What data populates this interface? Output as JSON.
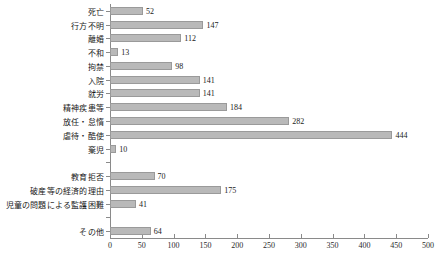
{
  "chart_data": {
    "type": "bar",
    "orientation": "horizontal",
    "title": "",
    "xlabel": "",
    "ylabel": "",
    "xlim": [
      0,
      500
    ],
    "xticks": [
      0,
      50,
      100,
      150,
      200,
      250,
      300,
      350,
      400,
      450,
      500
    ],
    "grid": false,
    "legend": null,
    "bar_color": "#b9b9b9",
    "bar_border_color": "#9a9a9a",
    "axis_color": "#8a8a8a",
    "categories": [
      "死亡",
      "行方不明",
      "離婚",
      "不和",
      "拘禁",
      "入院",
      "就労",
      "精神疾患等",
      "放任・怠惰",
      "虐待・酷使",
      "棄児",
      "",
      "教育拒否",
      "破産等の経済的理由",
      "児童の問題による監護困難",
      "",
      "その他"
    ],
    "values": [
      52,
      147,
      112,
      13,
      98,
      141,
      141,
      184,
      282,
      444,
      10,
      null,
      70,
      175,
      41,
      null,
      64
    ],
    "rows": [
      {
        "label": "死亡",
        "value": 52,
        "value_text": "52"
      },
      {
        "label": "行方不明",
        "value": 147,
        "value_text": "147"
      },
      {
        "label": "離婚",
        "value": 112,
        "value_text": "112"
      },
      {
        "label": "不和",
        "value": 13,
        "value_text": "13"
      },
      {
        "label": "拘禁",
        "value": 98,
        "value_text": "98"
      },
      {
        "label": "入院",
        "value": 141,
        "value_text": "141"
      },
      {
        "label": "就労",
        "value": 141,
        "value_text": "141"
      },
      {
        "label": "精神疾患等",
        "value": 184,
        "value_text": "184"
      },
      {
        "label": "放任・怠惰",
        "value": 282,
        "value_text": "282"
      },
      {
        "label": "虐待・酷使",
        "value": 444,
        "value_text": "444"
      },
      {
        "label": "棄児",
        "value": 10,
        "value_text": "10"
      },
      {
        "label": "",
        "value": null,
        "value_text": ""
      },
      {
        "label": "教育拒否",
        "value": 70,
        "value_text": "70"
      },
      {
        "label": "破産等の経済的理由",
        "value": 175,
        "value_text": "175"
      },
      {
        "label": "児童の問題による監護困難",
        "value": 41,
        "value_text": "41"
      },
      {
        "label": "",
        "value": null,
        "value_text": ""
      },
      {
        "label": "その他",
        "value": 64,
        "value_text": "64"
      }
    ]
  }
}
